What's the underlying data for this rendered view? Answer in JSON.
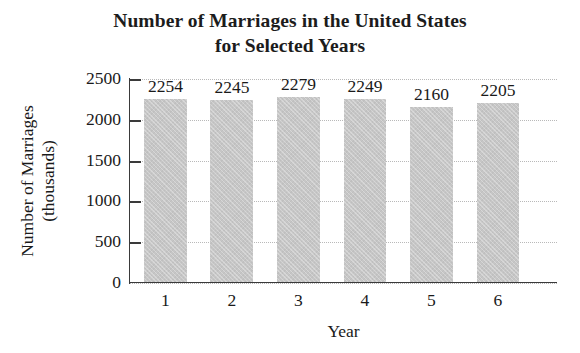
{
  "chart_data": {
    "type": "bar",
    "title": "Number of Marriages in the United States for Selected Years",
    "title_lines": [
      "Number of Marriages in the United States",
      "for Selected Years"
    ],
    "categories": [
      "1",
      "2",
      "3",
      "4",
      "5",
      "6"
    ],
    "values": [
      2254,
      2245,
      2279,
      2249,
      2160,
      2205
    ],
    "data_labels": [
      "2254",
      "2245",
      "2279",
      "2249",
      "2160",
      "2205"
    ],
    "xlabel": "Year",
    "ylabel": "Number of Marriages (thousands)",
    "ylabel_lines": [
      "Number of Marriages",
      "(thousands)"
    ],
    "ylim": [
      0,
      2500
    ],
    "yticks": [
      0,
      500,
      1000,
      1500,
      2000,
      2500
    ],
    "ytick_labels": [
      "0",
      "500",
      "1000",
      "1500",
      "2000",
      "2500"
    ],
    "grid": true,
    "grid_axis": "y",
    "legend": false,
    "bar_color": "#c6c6c6",
    "axis_color": "#3a3a3a",
    "gridline_color": "#b9b9b9",
    "background_color": "#ffffff"
  }
}
